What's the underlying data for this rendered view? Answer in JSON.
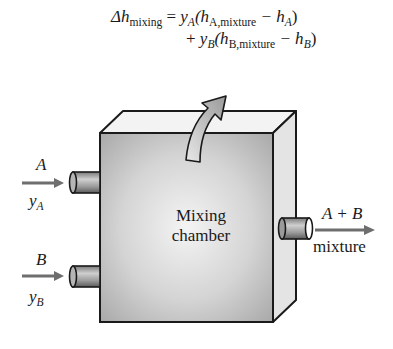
{
  "equation": {
    "line1": {
      "lhs_symbol": "Δh",
      "lhs_sub": "mixing",
      "eq": " = ",
      "coef": "y",
      "coef_sub": "A",
      "open": "(h",
      "term_sub": "A,mixture",
      "minus": " − h",
      "ref_sub": "A",
      "close": ")"
    },
    "line2": {
      "plus": "+ ",
      "coef": "y",
      "coef_sub": "B",
      "open": "(h",
      "term_sub": "B,mixture",
      "minus": " − h",
      "ref_sub": "B",
      "close": ")"
    }
  },
  "chamber": {
    "line1": "Mixing",
    "line2": "chamber"
  },
  "inlets": [
    {
      "species": "A",
      "fraction_symbol": "y",
      "fraction_sub": "A"
    },
    {
      "species": "B",
      "fraction_symbol": "y",
      "fraction_sub": "B"
    }
  ],
  "outlet": {
    "species": "A + B",
    "label": "mixture"
  },
  "colors": {
    "outline": "#1a1a1a",
    "front_face": "#c8c8c8",
    "top_face": "#f2f2f2",
    "side_face": "#e2e2e2",
    "arrow": "#6e6e6e",
    "heat_arrow": "#bdbdbd"
  }
}
